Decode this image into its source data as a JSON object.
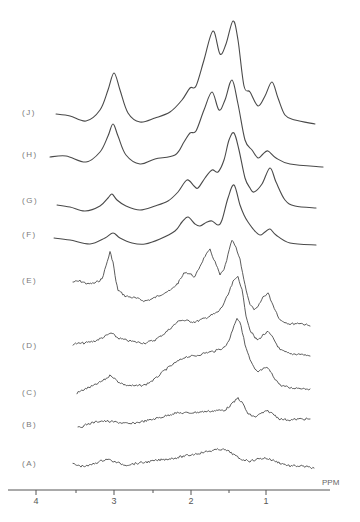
{
  "chart_data": {
    "type": "line",
    "title": "",
    "xlabel": "PPM",
    "ylabel": "",
    "x_axis": {
      "reversed": true,
      "range": [
        4.4,
        0.2
      ],
      "major_ticks": [
        4,
        3,
        2,
        1
      ],
      "minor_ticks": [
        3.5,
        2.5,
        1.5
      ],
      "tick_labels": [
        "4",
        "3",
        "2",
        "1"
      ]
    },
    "grid": false,
    "legend": "labels at left of each stacked trace",
    "series": [
      {
        "name": "(J)",
        "noisy": false,
        "peaks_ppm": [
          3.0,
          2.0,
          1.7,
          1.45,
          1.25,
          0.95
        ],
        "points": [
          [
            56,
            114
          ],
          [
            70,
            116
          ],
          [
            86,
            121
          ],
          [
            100,
            110
          ],
          [
            108,
            90
          ],
          [
            114,
            73
          ],
          [
            120,
            90
          ],
          [
            128,
            113
          ],
          [
            140,
            122
          ],
          [
            155,
            118
          ],
          [
            170,
            112
          ],
          [
            182,
            100
          ],
          [
            190,
            88
          ],
          [
            196,
            86
          ],
          [
            204,
            60
          ],
          [
            213,
            31
          ],
          [
            220,
            54
          ],
          [
            226,
            44
          ],
          [
            233,
            21
          ],
          [
            238,
            40
          ],
          [
            244,
            86
          ],
          [
            250,
            92
          ],
          [
            258,
            106
          ],
          [
            265,
            96
          ],
          [
            272,
            82
          ],
          [
            278,
            98
          ],
          [
            285,
            115
          ],
          [
            295,
            120
          ],
          [
            315,
            124
          ]
        ]
      },
      {
        "name": "(H)",
        "noisy": false,
        "peaks_ppm": [
          3.0,
          2.0,
          1.7,
          1.45,
          0.95
        ],
        "points": [
          [
            50,
            157
          ],
          [
            66,
            156
          ],
          [
            86,
            162
          ],
          [
            100,
            152
          ],
          [
            108,
            136
          ],
          [
            113,
            124
          ],
          [
            118,
            136
          ],
          [
            126,
            155
          ],
          [
            140,
            164
          ],
          [
            155,
            159
          ],
          [
            175,
            155
          ],
          [
            184,
            142
          ],
          [
            190,
            133
          ],
          [
            196,
            131
          ],
          [
            204,
            110
          ],
          [
            212,
            92
          ],
          [
            219,
            110
          ],
          [
            225,
            100
          ],
          [
            232,
            80
          ],
          [
            238,
            104
          ],
          [
            245,
            140
          ],
          [
            252,
            150
          ],
          [
            258,
            158
          ],
          [
            263,
            154
          ],
          [
            268,
            151
          ],
          [
            276,
            158
          ],
          [
            290,
            164
          ],
          [
            323,
            167
          ]
        ]
      },
      {
        "name": "(G)",
        "noisy": false,
        "peaks_ppm": [
          3.0,
          2.0,
          1.7,
          1.45,
          0.95
        ],
        "points": [
          [
            57,
            205
          ],
          [
            70,
            207
          ],
          [
            85,
            211
          ],
          [
            100,
            206
          ],
          [
            108,
            198
          ],
          [
            112,
            194
          ],
          [
            117,
            200
          ],
          [
            126,
            206
          ],
          [
            140,
            210
          ],
          [
            155,
            206
          ],
          [
            168,
            201
          ],
          [
            178,
            192
          ],
          [
            187,
            180
          ],
          [
            194,
            186
          ],
          [
            198,
            188
          ],
          [
            205,
            178
          ],
          [
            212,
            170
          ],
          [
            218,
            172
          ],
          [
            224,
            160
          ],
          [
            229,
            140
          ],
          [
            234,
            133
          ],
          [
            239,
            150
          ],
          [
            245,
            178
          ],
          [
            250,
            188
          ],
          [
            254,
            192
          ],
          [
            262,
            184
          ],
          [
            270,
            168
          ],
          [
            276,
            182
          ],
          [
            285,
            200
          ],
          [
            295,
            206
          ],
          [
            316,
            208
          ]
        ]
      },
      {
        "name": "(F)",
        "noisy": false,
        "peaks_ppm": [
          3.0,
          2.0,
          1.7,
          1.45,
          0.95
        ],
        "points": [
          [
            54,
            238
          ],
          [
            70,
            240
          ],
          [
            90,
            244
          ],
          [
            105,
            238
          ],
          [
            113,
            233
          ],
          [
            120,
            238
          ],
          [
            132,
            243
          ],
          [
            145,
            244
          ],
          [
            160,
            239
          ],
          [
            175,
            231
          ],
          [
            182,
            222
          ],
          [
            188,
            217
          ],
          [
            195,
            224
          ],
          [
            200,
            226
          ],
          [
            207,
            222
          ],
          [
            212,
            221
          ],
          [
            218,
            225
          ],
          [
            222,
            220
          ],
          [
            228,
            198
          ],
          [
            234,
            185
          ],
          [
            240,
            205
          ],
          [
            244,
            215
          ],
          [
            248,
            222
          ],
          [
            254,
            230
          ],
          [
            260,
            235
          ],
          [
            265,
            232
          ],
          [
            270,
            229
          ],
          [
            276,
            235
          ],
          [
            290,
            243
          ],
          [
            316,
            245
          ]
        ]
      },
      {
        "name": "(E)",
        "noisy": true,
        "peaks_ppm": [
          3.05,
          1.8,
          1.45,
          0.95
        ],
        "points": [
          [
            73,
            282
          ],
          [
            80,
            281
          ],
          [
            88,
            284
          ],
          [
            95,
            283
          ],
          [
            102,
            279
          ],
          [
            106,
            266
          ],
          [
            110,
            252
          ],
          [
            113,
            262
          ],
          [
            116,
            282
          ],
          [
            118,
            290
          ],
          [
            125,
            296
          ],
          [
            135,
            298
          ],
          [
            145,
            301
          ],
          [
            152,
            299
          ],
          [
            160,
            295
          ],
          [
            166,
            292
          ],
          [
            170,
            291
          ],
          [
            178,
            283
          ],
          [
            185,
            272
          ],
          [
            190,
            274
          ],
          [
            195,
            277
          ],
          [
            200,
            266
          ],
          [
            205,
            256
          ],
          [
            210,
            250
          ],
          [
            215,
            262
          ],
          [
            220,
            275
          ],
          [
            224,
            270
          ],
          [
            228,
            255
          ],
          [
            232,
            240
          ],
          [
            236,
            248
          ],
          [
            240,
            260
          ],
          [
            245,
            285
          ],
          [
            250,
            305
          ],
          [
            255,
            310
          ],
          [
            258,
            307
          ],
          [
            263,
            297
          ],
          [
            268,
            293
          ],
          [
            273,
            305
          ],
          [
            280,
            320
          ],
          [
            290,
            324
          ],
          [
            300,
            323
          ],
          [
            310,
            326
          ]
        ]
      },
      {
        "name": "(D)",
        "noisy": true,
        "peaks_ppm": [
          3.0,
          1.4,
          0.95
        ],
        "points": [
          [
            73,
            344
          ],
          [
            85,
            343
          ],
          [
            95,
            341
          ],
          [
            104,
            337
          ],
          [
            111,
            333
          ],
          [
            118,
            338
          ],
          [
            125,
            340
          ],
          [
            135,
            342
          ],
          [
            145,
            343
          ],
          [
            155,
            340
          ],
          [
            165,
            333
          ],
          [
            173,
            326
          ],
          [
            180,
            320
          ],
          [
            188,
            321
          ],
          [
            195,
            322
          ],
          [
            203,
            319
          ],
          [
            210,
            316
          ],
          [
            218,
            312
          ],
          [
            222,
            307
          ],
          [
            228,
            295
          ],
          [
            233,
            282
          ],
          [
            238,
            276
          ],
          [
            242,
            290
          ],
          [
            246,
            315
          ],
          [
            250,
            330
          ],
          [
            255,
            338
          ],
          [
            258,
            340
          ],
          [
            263,
            335
          ],
          [
            268,
            332
          ],
          [
            273,
            338
          ],
          [
            280,
            350
          ],
          [
            290,
            354
          ],
          [
            300,
            354
          ],
          [
            310,
            356
          ]
        ]
      },
      {
        "name": "(C)",
        "noisy": true,
        "peaks_ppm": [
          3.0,
          1.4,
          0.95
        ],
        "points": [
          [
            77,
            393
          ],
          [
            83,
            390
          ],
          [
            95,
            385
          ],
          [
            104,
            380
          ],
          [
            111,
            375
          ],
          [
            117,
            381
          ],
          [
            125,
            385
          ],
          [
            135,
            386
          ],
          [
            145,
            385
          ],
          [
            155,
            379
          ],
          [
            165,
            370
          ],
          [
            175,
            363
          ],
          [
            185,
            357
          ],
          [
            195,
            356
          ],
          [
            205,
            353
          ],
          [
            215,
            351
          ],
          [
            225,
            347
          ],
          [
            230,
            338
          ],
          [
            234,
            325
          ],
          [
            237,
            318
          ],
          [
            241,
            325
          ],
          [
            245,
            345
          ],
          [
            250,
            360
          ],
          [
            255,
            370
          ],
          [
            258,
            372
          ],
          [
            263,
            369
          ],
          [
            268,
            368
          ],
          [
            273,
            376
          ],
          [
            280,
            385
          ],
          [
            290,
            388
          ],
          [
            300,
            388
          ],
          [
            310,
            389
          ]
        ]
      },
      {
        "name": "(B)",
        "noisy": true,
        "peaks_ppm": [
          1.4,
          0.95
        ],
        "points": [
          [
            78,
            428
          ],
          [
            88,
            424
          ],
          [
            100,
            421
          ],
          [
            115,
            422
          ],
          [
            130,
            424
          ],
          [
            140,
            422
          ],
          [
            150,
            420
          ],
          [
            162,
            417
          ],
          [
            175,
            413
          ],
          [
            188,
            413
          ],
          [
            200,
            412
          ],
          [
            212,
            411
          ],
          [
            225,
            410
          ],
          [
            232,
            404
          ],
          [
            238,
            398
          ],
          [
            243,
            404
          ],
          [
            248,
            414
          ],
          [
            255,
            417
          ],
          [
            262,
            413
          ],
          [
            268,
            411
          ],
          [
            273,
            414
          ],
          [
            280,
            419
          ],
          [
            290,
            420
          ],
          [
            300,
            419
          ],
          [
            310,
            419
          ]
        ]
      },
      {
        "name": "(A)",
        "noisy": true,
        "peaks_ppm": [
          3.1,
          1.65,
          1.0
        ],
        "points": [
          [
            73,
            464
          ],
          [
            80,
            466
          ],
          [
            88,
            466
          ],
          [
            98,
            462
          ],
          [
            107,
            459
          ],
          [
            115,
            462
          ],
          [
            125,
            465
          ],
          [
            140,
            463
          ],
          [
            160,
            460
          ],
          [
            175,
            458
          ],
          [
            190,
            455
          ],
          [
            205,
            452
          ],
          [
            215,
            450
          ],
          [
            222,
            449
          ],
          [
            230,
            452
          ],
          [
            240,
            459
          ],
          [
            250,
            461
          ],
          [
            258,
            459
          ],
          [
            265,
            458
          ],
          [
            272,
            460
          ],
          [
            280,
            463
          ],
          [
            290,
            466
          ],
          [
            300,
            466
          ],
          [
            314,
            468
          ]
        ]
      }
    ]
  },
  "labels": {
    "J": "(J)",
    "H": "(H)",
    "G": "(G)",
    "F": "(F)",
    "E": "(E)",
    "D": "(D)",
    "C": "(C)",
    "B": "(B)",
    "A": "(A)"
  },
  "axis": {
    "unit": "PPM",
    "tick_4": "4",
    "tick_3": "3",
    "tick_2": "2",
    "tick_1": "1"
  }
}
